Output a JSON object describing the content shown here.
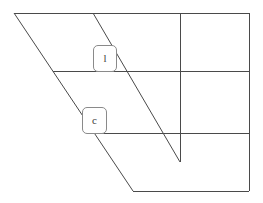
{
  "canvas": {
    "width": 263,
    "height": 203,
    "background_color": "#ffffff",
    "stroke_color": "#4a4a4a",
    "stroke_width": 1
  },
  "diagram": {
    "title": "",
    "type": "line-drawing",
    "outline": {
      "name": "trapezoid-outline",
      "points": "14,13 249,13 249,191 133,191",
      "closed": true
    },
    "segments": [
      {
        "name": "top-edge",
        "x1": 14,
        "y1": 13,
        "x2": 249,
        "y2": 13
      },
      {
        "name": "right-edge",
        "x1": 249,
        "y1": 13,
        "x2": 249,
        "y2": 191
      },
      {
        "name": "bottom-edge",
        "x1": 249,
        "y1": 191,
        "x2": 133,
        "y2": 191
      },
      {
        "name": "left-diagonal-edge",
        "x1": 133,
        "y1": 191,
        "x2": 14,
        "y2": 13
      },
      {
        "name": "horizontal-line-upper",
        "x1": 53,
        "y1": 71,
        "x2": 249,
        "y2": 71
      },
      {
        "name": "horizontal-line-lower",
        "x1": 95,
        "y1": 133,
        "x2": 249,
        "y2": 133
      },
      {
        "name": "vertical-line",
        "x1": 180,
        "y1": 13,
        "x2": 180,
        "y2": 162
      },
      {
        "name": "interior-diagonal",
        "x1": 93,
        "y1": 13,
        "x2": 180,
        "y2": 162
      }
    ],
    "labels": [
      {
        "name": "label-l",
        "text": "l",
        "x": 93,
        "y": 45,
        "width": 24,
        "height": 27
      },
      {
        "name": "label-c",
        "text": "c",
        "x": 82,
        "y": 107,
        "width": 25,
        "height": 27
      }
    ]
  }
}
